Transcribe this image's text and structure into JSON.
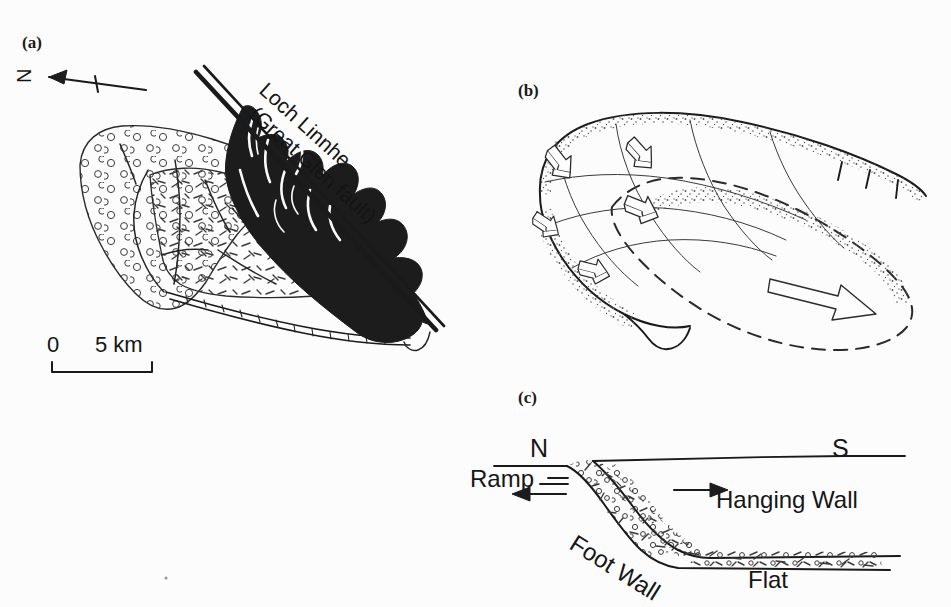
{
  "figure": {
    "background_color": "#fcfcfc",
    "ink_color": "#252525",
    "width": 951,
    "height": 607
  },
  "panel_a": {
    "label": "(a)",
    "type": "geological-map",
    "north_arrow": {
      "label": "N",
      "direction": "left"
    },
    "fault_label_line1": "Loch Linnhe",
    "fault_label_line2": "(Great Glen fault)",
    "fault_label_rotation_deg": 42,
    "scale_bar": {
      "start_label": "0",
      "end_label": "5 km",
      "length_km": 5
    },
    "legend_units": [
      {
        "name": "conglomerate",
        "pattern": "open-circle-stipple"
      },
      {
        "name": "sandstone",
        "pattern": "dash-tick"
      },
      {
        "name": "basement",
        "pattern": "solid-black"
      }
    ]
  },
  "panel_b": {
    "label": "(b)",
    "type": "block-diagram",
    "description": "Thrust sheet lobe with restored (dashed) outline and transport arrow",
    "annotations": [
      {
        "name": "small-block-arrow",
        "count": 5
      },
      {
        "name": "large-transport-arrow",
        "count": 1
      },
      {
        "name": "thrust-hachure-ticks",
        "count": 3
      },
      {
        "name": "restored-outline",
        "style": "dashed"
      },
      {
        "name": "stipple-margin",
        "style": "dotted"
      }
    ]
  },
  "panel_c": {
    "label": "(c)",
    "type": "cross-section",
    "direction_left": "N",
    "direction_right": "S",
    "labels": {
      "ramp": "Ramp",
      "foot_wall": "Foot Wall",
      "hanging_wall": "Hanging Wall",
      "flat": "Flat"
    },
    "foot_wall_rotation_deg": -30,
    "arrows": [
      {
        "name": "ramp-arrow",
        "direction": "left"
      },
      {
        "name": "hanging-wall-arrow",
        "direction": "right"
      }
    ]
  }
}
